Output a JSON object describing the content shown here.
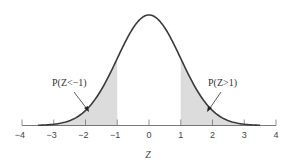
{
  "chart_data": {
    "type": "area",
    "title": "",
    "subtitle": "Standard normal distribution with shaded tails",
    "xlabel": "Z",
    "ylabel": "",
    "xlim": [
      -4,
      4
    ],
    "x_ticks": [
      -4,
      -3,
      -2,
      -1,
      0,
      1,
      2,
      3,
      4
    ],
    "x_tick_labels": [
      "−4",
      "−3",
      "−2",
      "−1",
      "0",
      "1",
      "2",
      "3",
      "4"
    ],
    "grid": false,
    "legend": null,
    "series": [
      {
        "name": "Standard normal density",
        "function": "pdf(z) = exp(-z^2/2)/sqrt(2*pi)",
        "mean": 0,
        "sd": 1,
        "x_range": [
          -3.5,
          3.5
        ],
        "line_color": "#3a3a3a"
      }
    ],
    "shaded_regions": [
      {
        "label": "P(Z<−1)",
        "from": -3.5,
        "to": -1,
        "color": "#dcdcdc"
      },
      {
        "label": "P(Z>1)",
        "from": 1,
        "to": 3.5,
        "color": "#dcdcdc"
      }
    ],
    "annotations": [
      {
        "text": "P(Z<−1)",
        "position": "left tail",
        "arrow_to_z": -1.9
      },
      {
        "text": "P(Z>1)",
        "position": "right tail",
        "arrow_to_z": 1.9
      }
    ]
  },
  "labels": {
    "axis_x": "Z",
    "annot_left": "P(Z<−1)",
    "annot_right": "P(Z>1)",
    "ticks": [
      "−4",
      "−3",
      "−2",
      "−1",
      "0",
      "1",
      "2",
      "3",
      "4"
    ]
  }
}
